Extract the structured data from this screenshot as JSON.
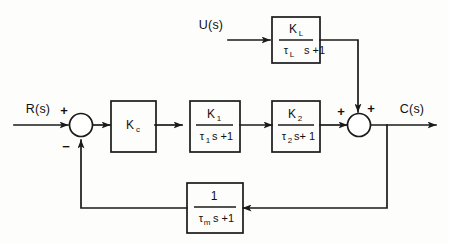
{
  "diagram": {
    "stroke_color": "#1a1a1a",
    "background_color": "#fdfdfb",
    "signals": {
      "reference_input": "R(s)",
      "disturbance_input": "U(s)",
      "output": "C(s)"
    },
    "blocks": [
      {
        "id": "load-block",
        "numerator": "K",
        "numerator_sub": "L",
        "denominator": "τ",
        "denominator_sub": "L",
        "denominator_tail": "s +1"
      },
      {
        "id": "controller-block",
        "numerator": "K",
        "numerator_sub": "c",
        "denominator": "",
        "denominator_sub": "",
        "denominator_tail": ""
      },
      {
        "id": "process-block-1",
        "numerator": "K",
        "numerator_sub": "1",
        "denominator": "τ",
        "denominator_sub": "1",
        "denominator_tail": "s +1"
      },
      {
        "id": "process-block-2",
        "numerator": "K",
        "numerator_sub": "2",
        "denominator": "τ",
        "denominator_sub": "2",
        "denominator_tail": "s+ 1"
      },
      {
        "id": "measurement-block",
        "numerator": "1",
        "numerator_sub": "",
        "denominator": "τ",
        "denominator_sub": "m",
        "denominator_tail": "s +1"
      }
    ],
    "summing_junctions": [
      {
        "id": "error-junction",
        "sign_in_reference": "+",
        "sign_in_feedback": "−"
      },
      {
        "id": "output-junction",
        "sign_in_forward": "+",
        "sign_in_load": "+"
      }
    ]
  }
}
